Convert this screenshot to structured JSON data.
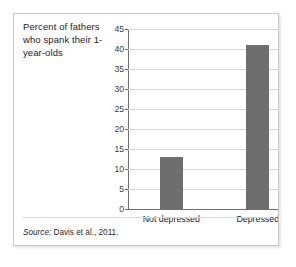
{
  "figure": {
    "caption": "Percent of fathers who spank their 1-year-olds",
    "source_word": "Source:",
    "source_text": " Davis et al., 2011.",
    "bar_color": "#6e6e6e",
    "axis_color": "#6f6f6f",
    "grid_color": "#d6d6d6",
    "border_color": "#c9c9c9",
    "background": "#ffffff"
  },
  "chart_data": {
    "type": "bar",
    "title": "Percent of fathers who spank their 1-year-olds",
    "xlabel": "",
    "ylabel": "",
    "categories": [
      "Not depressed",
      "Depressed"
    ],
    "values": [
      13,
      41
    ],
    "ylim": [
      0,
      45
    ],
    "yticks": [
      0,
      5,
      10,
      15,
      20,
      25,
      30,
      35,
      40,
      45
    ],
    "ytick_labels": [
      "0",
      "5",
      "10",
      "15",
      "20",
      "25",
      "30",
      "35",
      "40",
      "45"
    ],
    "grid": "horizontal",
    "legend": "none",
    "series": [
      {
        "name": "Percent who spank",
        "values": [
          13,
          41
        ]
      }
    ],
    "annotations": [
      "Source: Davis et al., 2011."
    ]
  }
}
